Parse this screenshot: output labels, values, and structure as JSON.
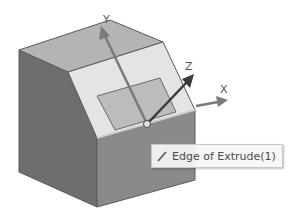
{
  "viewport": {
    "background": "#ffffff"
  },
  "model": {
    "colors": {
      "top_face": "#b4b4b4",
      "chamfer_face": "#e4e4e4",
      "left_face": "#6e6e6e",
      "front_face": "#8a8a8a",
      "sketch_plane": "#bcbcbc",
      "edge": "#5a5a5a"
    }
  },
  "triad": {
    "axes": [
      {
        "name": "X",
        "label": "X",
        "color": "#7a7a7a"
      },
      {
        "name": "Y",
        "label": "Y",
        "color": "#7a7a7a"
      },
      {
        "name": "Z",
        "label": "Z",
        "color": "#3a3a3a"
      }
    ]
  },
  "tooltip": {
    "icon": "edge-icon",
    "text": "Edge of Extrude(1)"
  }
}
